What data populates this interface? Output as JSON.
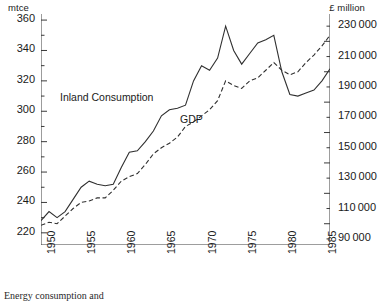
{
  "axes": {
    "left_unit": "mtce",
    "right_unit": "£ million",
    "left_ticks": [
      "360",
      "340",
      "320",
      "300",
      "280",
      "260",
      "240",
      "220"
    ],
    "right_ticks": [
      "230000",
      "210000",
      "190000",
      "170000",
      "150000",
      "130000",
      "110000",
      "90000"
    ],
    "x_ticks": [
      "1950",
      "1955",
      "1960",
      "1965",
      "1970",
      "1975",
      "1980",
      "1985"
    ]
  },
  "labels": {
    "inland": "Inland Consumption",
    "gdp": "GDP"
  },
  "caption": "Energy consumption and",
  "chart_data": {
    "type": "line",
    "title": "",
    "xlabel": "",
    "ylabel": "mtce",
    "y2label": "£ million",
    "xlim": [
      1950,
      1986
    ],
    "ylim": [
      212,
      364
    ],
    "y2lim": [
      86000,
      238000
    ],
    "grid": false,
    "legend": "inline-annotations",
    "x": [
      1950,
      1951,
      1952,
      1953,
      1954,
      1955,
      1956,
      1957,
      1958,
      1959,
      1960,
      1961,
      1962,
      1963,
      1964,
      1965,
      1966,
      1967,
      1968,
      1969,
      1970,
      1971,
      1972,
      1973,
      1974,
      1975,
      1976,
      1977,
      1978,
      1979,
      1980,
      1981,
      1982,
      1983,
      1984,
      1985,
      1986
    ],
    "series": [
      {
        "name": "Inland Consumption",
        "axis": "left",
        "unit": "mtce",
        "style": "solid",
        "values": [
          228,
          234,
          230,
          234,
          242,
          250,
          254,
          252,
          251,
          252,
          263,
          273,
          274,
          280,
          287,
          297,
          301,
          302,
          304,
          320,
          330,
          327,
          335,
          356,
          340,
          331,
          338,
          345,
          347,
          350,
          326,
          311,
          310,
          312,
          314,
          320,
          328
        ]
      },
      {
        "name": "GDP",
        "axis": "right",
        "unit": "£ million",
        "style": "dashed",
        "values": [
          99000,
          101000,
          100000,
          105000,
          110000,
          114000,
          115000,
          117000,
          117000,
          122000,
          128000,
          131000,
          133000,
          139000,
          146000,
          150000,
          153000,
          157000,
          164000,
          167000,
          171000,
          175000,
          181000,
          194000,
          191000,
          189000,
          194000,
          196000,
          201000,
          206000,
          201000,
          198000,
          200000,
          206000,
          211000,
          217000,
          224000
        ]
      }
    ]
  }
}
